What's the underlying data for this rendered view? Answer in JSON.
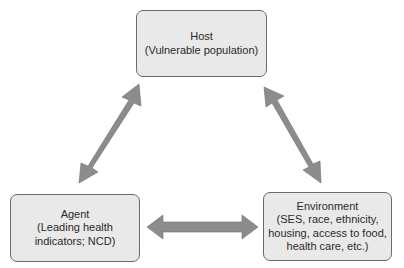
{
  "diagram": {
    "type": "epidemiologic triangle",
    "colors": {
      "box_fill": "#e9e9e9",
      "box_border": "#6a6a6a",
      "arrow_fill": "#8c8c8c",
      "text": "#2a2a2a"
    },
    "nodes": {
      "host": {
        "title": "Host",
        "detail_lines": [
          "(Vulnerable population)"
        ]
      },
      "agent": {
        "title": "Agent",
        "detail_lines": [
          "(Leading health",
          "indicators; NCD)"
        ]
      },
      "environment": {
        "title": "Environment",
        "detail_lines": [
          "(SES, race, ethnicity,",
          "housing, access to food,",
          "health care, etc.)"
        ]
      }
    },
    "edges": [
      {
        "from": "host",
        "to": "agent",
        "style": "double-headed arrow"
      },
      {
        "from": "host",
        "to": "environment",
        "style": "double-headed arrow"
      },
      {
        "from": "agent",
        "to": "environment",
        "style": "double-headed arrow"
      }
    ]
  }
}
